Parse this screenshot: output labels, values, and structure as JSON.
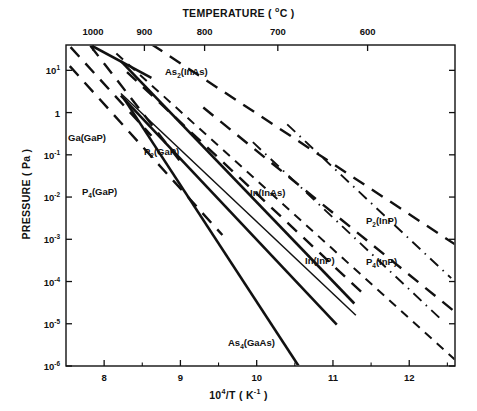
{
  "chart_data": {
    "type": "line",
    "title": "",
    "xlabel": "10^4/T ( K^-1 )",
    "ylabel": "PRESSURE ( Pa )",
    "top_axis_label": "TEMPERATURE ( oC )",
    "xlim": [
      7.5,
      12.6
    ],
    "ylim_log": [
      -6,
      1.6
    ],
    "grid": false,
    "legend": "inline-annotations",
    "x_ticks": [
      "8",
      "9",
      "10",
      "11",
      "12"
    ],
    "x_tick_values": [
      8,
      9,
      10,
      11,
      12
    ],
    "x_minor_tick_values": [
      7.5,
      8.5,
      9.5,
      10.5,
      11.5,
      12.5
    ],
    "y_ticks": [
      "10^1",
      "1",
      "10^-1",
      "10^-2",
      "10^-3",
      "10^-4",
      "10^-5",
      "10^-6"
    ],
    "y_tick_log_values": [
      1,
      0,
      -1,
      -2,
      -3,
      -4,
      -5,
      -6
    ],
    "top_ticks": [
      "1000",
      "900",
      "800",
      "700",
      "600"
    ],
    "top_tick_celsius": [
      1000,
      900,
      800,
      700,
      600
    ],
    "top_tick_x_values": [
      7.855,
      8.528,
      9.317,
      10.277,
      11.454
    ],
    "series": [
      {
        "name": "As2(InAs)",
        "label": "As2(InAs)",
        "label_sub": "2",
        "label_pre": "As",
        "label_post": "(InAs)",
        "style": "dashed-long",
        "points": [
          [
            8.62,
            1.62
          ],
          [
            12.6,
            -3.12
          ]
        ]
      },
      {
        "name": "In(InAs)",
        "label": "In(InAs)",
        "label_sub": "",
        "label_pre": "In(InAs)",
        "label_post": "",
        "style": "dashed-long",
        "points": [
          [
            9.3,
            0.12
          ],
          [
            12.6,
            -4.72
          ]
        ]
      },
      {
        "name": "P2(GaP)",
        "label": "P2(GaP)",
        "label_sub": "2",
        "label_pre": "P",
        "label_post": "(GaP)",
        "style": "solid-thick",
        "points": [
          [
            8.22,
            1.22
          ],
          [
            11.28,
            -4.52
          ]
        ]
      },
      {
        "name": "P4(GaP)",
        "label": "P4(GaP)",
        "label_sub": "4",
        "label_pre": "P",
        "label_post": "(GaP)",
        "style": "dashed-long",
        "points": [
          [
            7.55,
            1.1
          ],
          [
            9.55,
            -2.9
          ]
        ]
      },
      {
        "name": "Ga(GaP)",
        "label": "Ga(GaP)",
        "label_sub": "",
        "label_pre": "Ga(GaP)",
        "label_post": "",
        "style": "solid-thick",
        "points": [
          [
            8.22,
            0.4
          ],
          [
            11.05,
            -5.02
          ]
        ]
      },
      {
        "name": "As4(GaAs)",
        "label": "As4(GaAs)",
        "label_sub": "4",
        "label_pre": "As",
        "label_post": "(GaAs)",
        "style": "solid-thick",
        "points": [
          [
            8.26,
            0.33
          ],
          [
            10.55,
            -6.0
          ]
        ]
      },
      {
        "name": "In(InP)",
        "label": "In(InP)",
        "label_sub": "",
        "label_pre": "In(InP)",
        "label_post": "",
        "style": "dashed-short",
        "points": [
          [
            8.16,
            1.4
          ],
          [
            12.6,
            -5.85
          ]
        ]
      },
      {
        "name": "P2(InP)",
        "label": "P2(InP)",
        "label_sub": "2",
        "label_pre": "P",
        "label_post": "(InP)",
        "style": "dash-dot",
        "points": [
          [
            10.4,
            -0.28
          ],
          [
            12.55,
            -3.92
          ]
        ]
      },
      {
        "name": "P4(InP)",
        "label": "P4(InP)",
        "label_sub": "4",
        "label_pre": "P",
        "label_post": "(InP)",
        "style": "dash-dot",
        "points": [
          [
            9.95,
            -0.7
          ],
          [
            12.45,
            -4.95
          ]
        ]
      },
      {
        "name": "Ga(GaP)-second",
        "label": "",
        "style": "solid-thin",
        "points": [
          [
            8.22,
            0.45
          ],
          [
            11.3,
            -4.8
          ]
        ]
      },
      {
        "name": "upper-dashed-a",
        "label": "",
        "style": "dashed-long",
        "points": [
          [
            7.56,
            1.55
          ],
          [
            8.62,
            -0.55
          ]
        ]
      },
      {
        "name": "upper-dashed-b",
        "label": "",
        "style": "dashed-long",
        "points": [
          [
            7.82,
            1.58
          ],
          [
            9.05,
            -1.28
          ]
        ]
      },
      {
        "name": "upper-solid-thick",
        "label": "",
        "style": "solid-thick",
        "points": [
          [
            7.82,
            1.6
          ],
          [
            8.62,
            0.82
          ]
        ]
      },
      {
        "name": "mid-dashed-c",
        "label": "",
        "style": "dashed-long",
        "points": [
          [
            8.3,
            0.96
          ],
          [
            11.45,
            -4.38
          ]
        ]
      }
    ]
  },
  "annotations": [
    {
      "id": "as2-inas",
      "text_pre": "As",
      "sub": "2",
      "text_post": "(InAs)",
      "x": 165,
      "y": 66
    },
    {
      "id": "p2-gap",
      "text_pre": "P",
      "sub": "2",
      "text_post": "(GaP)",
      "x": 144,
      "y": 146
    },
    {
      "id": "ga-gap",
      "text_pre": "Ga(GaP)",
      "sub": "",
      "text_post": "",
      "x": 68,
      "y": 132
    },
    {
      "id": "p4-gap",
      "text_pre": "P",
      "sub": "4",
      "text_post": "(GaP)",
      "x": 82,
      "y": 186
    },
    {
      "id": "in-inas",
      "text_pre": "In(InAs)",
      "sub": "",
      "text_post": "",
      "x": 250,
      "y": 187
    },
    {
      "id": "p2-inp",
      "text_pre": "P",
      "sub": "2",
      "text_post": "(InP)",
      "x": 366,
      "y": 215
    },
    {
      "id": "in-inp",
      "text_pre": "In(InP)",
      "sub": "",
      "text_post": "",
      "x": 305,
      "y": 255
    },
    {
      "id": "p4-inp",
      "text_pre": "P",
      "sub": "4",
      "text_post": "(InP)",
      "x": 366,
      "y": 256
    },
    {
      "id": "as4-gaas",
      "text_pre": "As",
      "sub": "4",
      "text_post": "(GaAs)",
      "x": 228,
      "y": 337
    }
  ],
  "axes": {
    "top_title_pre": "TEMPERATURE ( ",
    "top_title_sup": "o",
    "top_title_post": "C )",
    "bottom_title_pre": "10",
    "bottom_title_sup": "4",
    "bottom_title_mid": "/T ( K",
    "bottom_title_sup2": "-1",
    "bottom_title_post": " )",
    "y_title": "PRESSURE ( Pa )"
  }
}
